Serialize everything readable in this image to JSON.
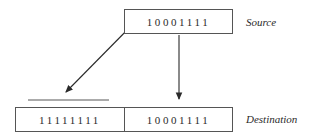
{
  "source": {
    "bits": "10001111",
    "label": "Source"
  },
  "destination": {
    "high_bits": "11111111",
    "low_bits": "10001111",
    "label": "Destination"
  },
  "arrows": [
    {
      "from": "source-msb",
      "to": "destination-high-byte",
      "meaning": "sign bit extension"
    },
    {
      "from": "source",
      "to": "destination-low-byte",
      "meaning": "copy"
    }
  ]
}
